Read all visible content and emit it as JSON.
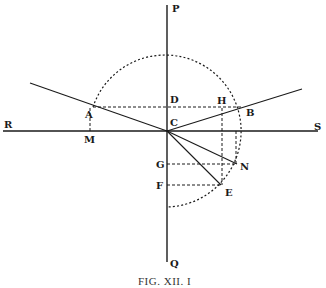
{
  "figure": {
    "caption": "Fig. XII. 1",
    "caption_display": "FIG. XII. I",
    "type": "geometric diagram of refraction of a ray at a surface",
    "colors": {
      "ink": "#1a1a1a",
      "background": "#ffffff"
    }
  },
  "points": {
    "P": {
      "label": "P",
      "x": 167,
      "y": 5
    },
    "Q": {
      "label": "Q",
      "x": 167,
      "y": 262
    },
    "R": {
      "label": "R",
      "x": 3,
      "y": 131
    },
    "S": {
      "label": "S",
      "x": 318,
      "y": 131
    },
    "C": {
      "label": "C",
      "x": 167,
      "y": 131
    },
    "A": {
      "label": "A",
      "x": 93,
      "y": 107
    },
    "B": {
      "label": "B",
      "x": 243,
      "y": 107
    },
    "D": {
      "label": "D",
      "x": 167,
      "y": 107
    },
    "H": {
      "label": "H",
      "x": 222,
      "y": 107
    },
    "M": {
      "label": "M",
      "x": 90,
      "y": 131
    },
    "G": {
      "label": "G",
      "x": 167,
      "y": 164
    },
    "N": {
      "label": "N",
      "x": 237,
      "y": 164
    },
    "F": {
      "label": "F",
      "x": 167,
      "y": 185
    },
    "E": {
      "label": "E",
      "x": 221,
      "y": 185
    }
  },
  "labels": {
    "P": "P",
    "Q": "Q",
    "R": "R",
    "S": "S",
    "C": "C",
    "A": "A",
    "B": "B",
    "D": "D",
    "H": "H",
    "M": "M",
    "G": "G",
    "N": "N",
    "F": "F",
    "E": "E"
  },
  "circle": {
    "cx": 167,
    "cy": 131,
    "r": 76,
    "style": "dotted"
  },
  "solid_lines": [
    {
      "name": "axis-PQ",
      "from": "P",
      "to": "Q"
    },
    {
      "name": "surface-RS",
      "from": "R",
      "to": "S"
    },
    {
      "name": "incident-ray",
      "from": [
        30,
        83
      ],
      "to": "C"
    },
    {
      "name": "refracted-ray-CB",
      "from": "C",
      "to": [
        302,
        89
      ]
    },
    {
      "name": "ray-CN",
      "from": "C",
      "to": "N"
    },
    {
      "name": "ray-CE",
      "from": "C",
      "to": "E"
    }
  ],
  "dashed_lines": [
    {
      "name": "chord-AB",
      "from": "A",
      "to": "B"
    },
    {
      "name": "perp-AM",
      "from": "A",
      "to": "M"
    },
    {
      "name": "perp-HE",
      "from": "H",
      "to": "E"
    },
    {
      "name": "perp-N",
      "from": [
        236,
        131
      ],
      "to": "N"
    },
    {
      "name": "line-GN",
      "from": "G",
      "to": "N"
    },
    {
      "name": "line-FE",
      "from": "F",
      "to": "E"
    }
  ]
}
